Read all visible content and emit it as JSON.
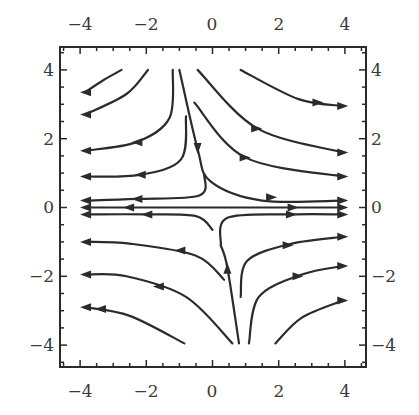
{
  "chart_data": {
    "type": "streamplot",
    "title": "",
    "xlabel": "",
    "ylabel": "",
    "xlim": [
      -4.6,
      4.6
    ],
    "ylim": [
      -4.6,
      4.6
    ],
    "grid": false,
    "legend": null,
    "x_major_ticks": [
      -4,
      -2,
      0,
      2,
      4
    ],
    "y_major_ticks": [
      -4,
      -2,
      0,
      2,
      4
    ],
    "x_tick_labels": [
      "−4",
      "−2",
      "0",
      "2",
      "4"
    ],
    "y_tick_labels": [
      "4",
      "2",
      "0",
      "−2",
      "−4"
    ],
    "minor_tick_step": 0.5,
    "ticks_on_all_sides": true,
    "labels_on_all_sides": true,
    "streamlines": [
      {
        "id": "ul1",
        "points": [
          [
            -2.75,
            4.0
          ],
          [
            -3.3,
            3.7
          ],
          [
            -3.85,
            3.35
          ]
        ],
        "arrows": [
          [
            -3.85,
            3.35,
            "left"
          ]
        ]
      },
      {
        "id": "ul2",
        "points": [
          [
            -1.95,
            4.0
          ],
          [
            -2.6,
            3.3
          ],
          [
            -3.85,
            2.7
          ]
        ],
        "arrows": [
          [
            -3.85,
            2.7,
            "left"
          ]
        ]
      },
      {
        "id": "ul3",
        "points": [
          [
            -1.2,
            4.0
          ],
          [
            -1.3,
            2.6
          ],
          [
            -2.3,
            1.9
          ],
          [
            -3.85,
            1.65
          ]
        ],
        "arrows": [
          [
            -2.3,
            1.9,
            "left"
          ],
          [
            -3.85,
            1.65,
            "left"
          ]
        ]
      },
      {
        "id": "ul4",
        "points": [
          [
            -0.8,
            2.65
          ],
          [
            -0.95,
            1.4
          ],
          [
            -2.2,
            0.95
          ],
          [
            -3.85,
            0.9
          ]
        ],
        "arrows": [
          [
            -2.2,
            0.95,
            "left"
          ],
          [
            -3.85,
            0.9,
            "left"
          ]
        ]
      },
      {
        "id": "ul5",
        "points": [
          [
            -0.25,
            0.95
          ],
          [
            -0.4,
            0.35
          ],
          [
            -2.3,
            0.25
          ],
          [
            -3.85,
            0.2
          ]
        ],
        "arrows": [
          [
            -2.3,
            0.25,
            "left"
          ],
          [
            -3.85,
            0.2,
            "left"
          ]
        ]
      },
      {
        "id": "sep_down",
        "points": [
          [
            -1.0,
            4.0
          ],
          [
            -0.45,
            1.7
          ],
          [
            -0.05,
            0.75
          ],
          [
            1.5,
            0.2
          ],
          [
            3.95,
            0.2
          ]
        ],
        "arrows": [
          [
            -0.45,
            1.7,
            "down"
          ],
          [
            1.8,
            0.3,
            "right"
          ],
          [
            3.95,
            0.2,
            "right"
          ]
        ]
      },
      {
        "id": "ur1",
        "points": [
          [
            0.85,
            4.0
          ],
          [
            2.6,
            3.15
          ],
          [
            3.95,
            2.95
          ]
        ],
        "arrows": [
          [
            3.2,
            3.05,
            "right"
          ],
          [
            3.95,
            2.95,
            "right"
          ]
        ]
      },
      {
        "id": "ur2",
        "points": [
          [
            -0.45,
            4.0
          ],
          [
            1.35,
            2.3
          ],
          [
            3.95,
            1.6
          ]
        ],
        "arrows": [
          [
            1.35,
            2.3,
            "right"
          ],
          [
            3.95,
            1.6,
            "right"
          ]
        ]
      },
      {
        "id": "ur3",
        "points": [
          [
            -0.55,
            3.05
          ],
          [
            1.0,
            1.45
          ],
          [
            3.95,
            0.9
          ]
        ],
        "arrows": [
          [
            1.0,
            1.45,
            "right"
          ],
          [
            3.95,
            0.9,
            "right"
          ]
        ]
      },
      {
        "id": "axis",
        "points": [
          [
            -3.85,
            0.0
          ],
          [
            3.95,
            0.0
          ]
        ],
        "arrows": [
          [
            -2.55,
            0.0,
            "left"
          ],
          [
            -3.85,
            0.0,
            "left"
          ],
          [
            2.45,
            0.0,
            "right"
          ],
          [
            3.95,
            0.0,
            "right"
          ]
        ]
      },
      {
        "id": "ll1",
        "points": [
          [
            0.0,
            -0.65
          ],
          [
            -0.5,
            -0.25
          ],
          [
            -2.0,
            -0.2
          ],
          [
            -3.85,
            -0.2
          ]
        ],
        "arrows": [
          [
            -2.0,
            -0.2,
            "left"
          ],
          [
            -3.85,
            -0.2,
            "left"
          ]
        ]
      },
      {
        "id": "lr1",
        "points": [
          [
            0.25,
            -1.1
          ],
          [
            0.45,
            -0.3
          ],
          [
            2.4,
            -0.2
          ],
          [
            3.95,
            -0.2
          ]
        ],
        "arrows": [
          [
            2.4,
            -0.2,
            "right"
          ],
          [
            3.95,
            -0.2,
            "right"
          ]
        ]
      },
      {
        "id": "ll2",
        "points": [
          [
            0.35,
            -2.1
          ],
          [
            -0.5,
            -1.4
          ],
          [
            -2.5,
            -1.05
          ],
          [
            -3.85,
            -1.0
          ]
        ],
        "arrows": [
          [
            -1.0,
            -1.25,
            "left"
          ],
          [
            -3.85,
            -1.0,
            "left"
          ]
        ]
      },
      {
        "id": "ll3",
        "points": [
          [
            0.6,
            -3.95
          ],
          [
            -0.8,
            -2.6
          ],
          [
            -2.6,
            -2.0
          ],
          [
            -3.85,
            -1.95
          ]
        ],
        "arrows": [
          [
            -1.65,
            -2.3,
            "left"
          ],
          [
            -3.85,
            -1.95,
            "left"
          ]
        ]
      },
      {
        "id": "ll4",
        "points": [
          [
            -0.85,
            -3.95
          ],
          [
            -2.5,
            -3.15
          ],
          [
            -3.85,
            -2.9
          ]
        ],
        "arrows": [
          [
            -3.4,
            -2.95,
            "left"
          ],
          [
            -3.85,
            -2.9,
            "left"
          ]
        ]
      },
      {
        "id": "up_sep",
        "points": [
          [
            0.8,
            -3.95
          ],
          [
            0.45,
            -1.75
          ],
          [
            0.25,
            -1.1
          ]
        ],
        "arrows": [
          [
            0.45,
            -1.75,
            "up"
          ]
        ]
      },
      {
        "id": "lr2",
        "points": [
          [
            0.85,
            -2.6
          ],
          [
            1.05,
            -1.55
          ],
          [
            2.4,
            -1.05
          ],
          [
            3.95,
            -0.85
          ]
        ],
        "arrows": [
          [
            2.3,
            -1.1,
            "right"
          ],
          [
            3.95,
            -0.85,
            "right"
          ]
        ]
      },
      {
        "id": "lr3",
        "points": [
          [
            1.1,
            -3.95
          ],
          [
            1.4,
            -2.6
          ],
          [
            2.7,
            -1.95
          ],
          [
            3.95,
            -1.7
          ]
        ],
        "arrows": [
          [
            2.6,
            -2.0,
            "right"
          ],
          [
            3.95,
            -1.7,
            "right"
          ]
        ]
      },
      {
        "id": "lr4",
        "points": [
          [
            1.9,
            -3.95
          ],
          [
            2.7,
            -3.2
          ],
          [
            3.95,
            -2.7
          ]
        ],
        "arrows": [
          [
            3.95,
            -2.7,
            "right"
          ]
        ]
      }
    ]
  }
}
